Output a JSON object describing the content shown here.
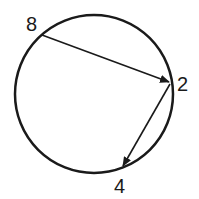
{
  "diagram": {
    "type": "circle-with-arrows",
    "circle": {
      "cx": 94,
      "cy": 94,
      "r": 79,
      "stroke": "#1a1a1a",
      "stroke_width": 2.5
    },
    "points": [
      {
        "label": "8",
        "x": 42,
        "y": 35,
        "label_x": 28,
        "label_y": 30
      },
      {
        "label": "2",
        "x": 171,
        "y": 82,
        "label_x": 178,
        "label_y": 90
      },
      {
        "label": "4",
        "x": 122,
        "y": 168,
        "label_x": 113,
        "label_y": 193
      }
    ],
    "arrows": [
      {
        "from": "8",
        "to": "2"
      },
      {
        "from": "2",
        "to": "4"
      }
    ],
    "color": "#1a1a1a"
  }
}
